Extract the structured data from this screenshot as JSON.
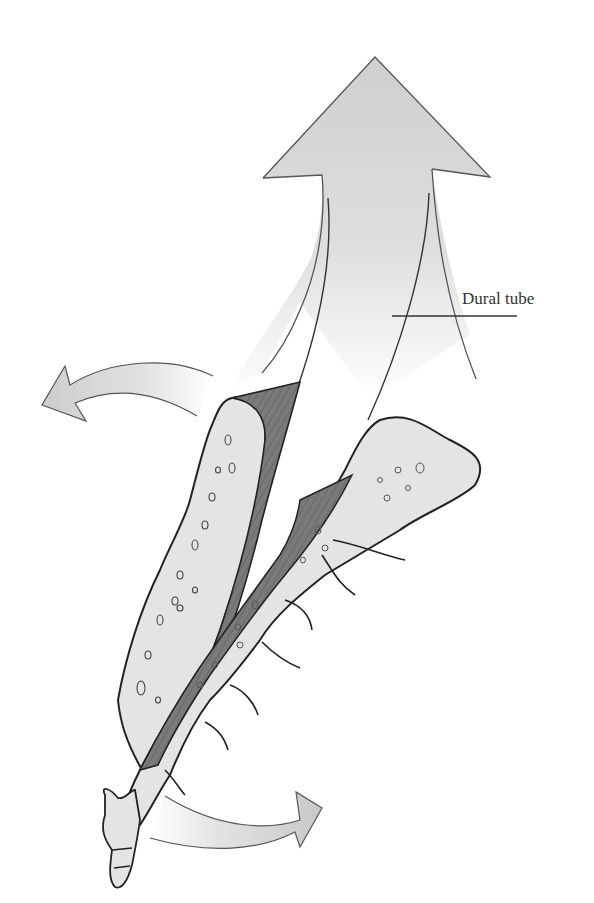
{
  "figure": {
    "labels": {
      "dural_tube": "Dural tube"
    },
    "colors": {
      "background": "#ffffff",
      "bone_fill": "#e4e4e4",
      "ligament_fill": "#7d7d7d",
      "arrow_fill": "#cfcfcf",
      "outline": "#2a2a2a",
      "label_text": "#333333"
    },
    "arrows": [
      {
        "name": "upward-large-arrow",
        "direction": "up"
      },
      {
        "name": "left-curved-arrow",
        "direction": "left"
      },
      {
        "name": "right-curved-arrow",
        "direction": "right"
      }
    ]
  }
}
